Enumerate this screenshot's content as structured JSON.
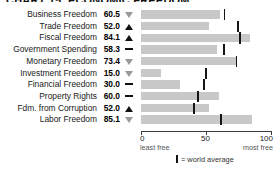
{
  "title": "CHART 15. ECONOMIC FREEDOM",
  "legend": {
    "marker": "world-average-marker",
    "text": "= world average"
  },
  "axis": {
    "ticks": [
      {
        "value": 0,
        "label": "0"
      },
      {
        "value": 50,
        "label": "50"
      },
      {
        "value": 100,
        "label": "100"
      }
    ],
    "left_sublabel": "least free",
    "right_sublabel": "most free",
    "min": 0,
    "max": 100
  },
  "colors": {
    "bar": "#c8c8c8",
    "world_average": "#151515",
    "trend_down": "#9a9a9a",
    "trend_up": "#111111"
  },
  "chart_data": {
    "type": "bar",
    "title": "CHART 15. ECONOMIC FREEDOM",
    "xlabel": "",
    "ylabel": "",
    "xlim": [
      0,
      100
    ],
    "grid": false,
    "legend_position": "bottom",
    "orientation": "horizontal",
    "categories": [
      "Business Freedom",
      "Trade Freedom",
      "Fiscal Freedom",
      "Government Spending",
      "Monetary Freedom",
      "Investment Freedom",
      "Financial Freedom",
      "Property Rights",
      "Fdm. from Corruption",
      "Labor Freedom"
    ],
    "values": [
      60.5,
      52.0,
      84.1,
      58.3,
      73.4,
      15.0,
      30.0,
      60.0,
      52.0,
      85.1
    ],
    "value_labels": [
      "60.5",
      "52.0",
      "84.1",
      "58.3",
      "73.4",
      "15.0",
      "30.0",
      "60.0",
      "52.0",
      "85.1"
    ],
    "trends": [
      "down",
      "up",
      "up",
      "flat",
      "down",
      "down",
      "flat",
      "flat",
      "up",
      "down"
    ],
    "trend_glyphs": [
      "▽",
      "▲",
      "▲",
      "—",
      "▽",
      "▽",
      "—",
      "—",
      "▲",
      "▽"
    ],
    "world_average": [
      64.3,
      74.9,
      76.3,
      63.9,
      73.4,
      50.2,
      48.5,
      43.6,
      40.5,
      61.5
    ],
    "series": [
      {
        "name": "Country score",
        "values": [
          60.5,
          52.0,
          84.1,
          58.3,
          73.4,
          15.0,
          30.0,
          60.0,
          52.0,
          85.1
        ]
      },
      {
        "name": "World average",
        "values": [
          64.3,
          74.9,
          76.3,
          63.9,
          73.4,
          50.2,
          48.5,
          43.6,
          40.5,
          61.5
        ]
      }
    ]
  }
}
